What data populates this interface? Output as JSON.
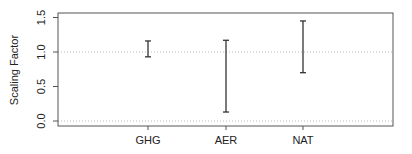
{
  "chart_data": {
    "type": "errorbar",
    "title": "",
    "xlabel": "",
    "ylabel": "Scaling Factor",
    "categories": [
      "GHG",
      "AER",
      "NAT"
    ],
    "series": [
      {
        "name": "Scaling factor range",
        "lower": [
          0.93,
          0.13,
          0.7
        ],
        "upper": [
          1.16,
          1.17,
          1.45
        ]
      }
    ],
    "ylim": [
      -0.07,
      1.57
    ],
    "yticks": [
      0.0,
      0.5,
      1.0,
      1.5
    ],
    "ytick_labels": [
      "0.0",
      "0.5",
      "1.0",
      "1.5"
    ],
    "reference_lines": [
      0.0,
      1.0
    ],
    "grid": false,
    "legend": null
  },
  "colors": {
    "frame": "#555555",
    "bars": "#333333",
    "reference_line": "#bbbbbb",
    "text": "#222222"
  }
}
